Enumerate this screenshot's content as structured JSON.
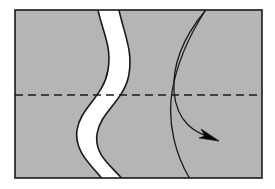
{
  "figure": {
    "title": "Sinuous band within sheared block with rotational shear arrows",
    "kind": "structural-block-diagram",
    "canvas": {
      "width": 275,
      "height": 189,
      "background": "#ffffff"
    }
  },
  "colors": {
    "block_fill": "#b5b5b5",
    "block_outline": "#1a1a1a",
    "band_fill": "#ffffff",
    "band_outline": "#1a1a1a",
    "dashed_line": "#1a1a1a",
    "arrow_stroke": "#1a1a1a",
    "arrow_head_fill": "#000000"
  },
  "block": {
    "name": "shaded-rectangular-block",
    "x": 15,
    "y": 10,
    "width": 247,
    "height": 168,
    "stroke_width": 1.6
  },
  "band": {
    "name": "white-sinuous-band",
    "description": "S-shaped vertical light band crossing the block from top edge to bottom edge",
    "left_edge_path": "M 97,10 C 103,34 112,46 108,70 C 104,96 80,108 77,130 C 74,152 92,164 105,178",
    "right_edge_path": "M 118,10 C 124,34 133,50 129,74 C 125,100 100,112 97,134 C 94,156 112,168 125,178",
    "stroke_width": 1.6,
    "top_span": [
      97,
      118
    ],
    "bottom_span": [
      105,
      125
    ]
  },
  "axial_line": {
    "name": "dashed-axial-trace",
    "y": 95,
    "x_start": 15,
    "x_end": 262,
    "dash_pattern": "8 5",
    "stroke_width": 1.6
  },
  "arrows": [
    {
      "name": "shear-arrow-curved-with-head",
      "path": "M 205,12 C 186,34 172,62 174,92 C 177,124 196,134 216,140",
      "stroke_width": 1.3,
      "head": {
        "tip_x": 219,
        "tip_y": 141,
        "points": "219,141 201,129 205,136 199,138"
      }
    },
    {
      "name": "shear-line-curved-no-head",
      "path": "M 205,12 C 189,36 177,62 172,92 C 167,124 176,156 190,178",
      "stroke_width": 1.3
    }
  ],
  "labels": {
    "none_visible": ""
  }
}
